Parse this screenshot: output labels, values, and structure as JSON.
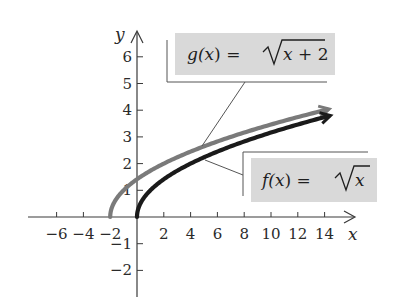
{
  "chart_data": {
    "type": "line",
    "title": "",
    "xlabel": "x",
    "ylabel": "y",
    "xlim": [
      -7.5,
      16
    ],
    "ylim": [
      -3,
      7
    ],
    "grid": false,
    "x_ticks": [
      -6,
      -4,
      -2,
      2,
      4,
      6,
      8,
      10,
      12,
      14
    ],
    "x_tick_labels": [
      "−6",
      "−4",
      "−2",
      "2",
      "4",
      "6",
      "8",
      "10",
      "12",
      "14"
    ],
    "y_ticks": [
      -2,
      -1,
      1,
      2,
      3,
      4,
      5,
      6
    ],
    "y_tick_labels": [
      "−2",
      "−1",
      "1",
      "2",
      "3",
      "4",
      "5",
      "6"
    ],
    "series": [
      {
        "name": "g(x) = √(x + 2)",
        "color": "#7a7a7a",
        "x": [
          -2,
          -1.5,
          -1,
          0,
          1,
          2,
          4,
          6,
          8,
          10,
          12,
          14
        ],
        "y": [
          0,
          0.71,
          1,
          1.41,
          1.73,
          2,
          2.45,
          2.83,
          3.16,
          3.46,
          3.74,
          4
        ]
      },
      {
        "name": "f(x) = √x",
        "color": "#1a1a1a",
        "x": [
          0,
          0.5,
          1,
          2,
          4,
          6,
          8,
          10,
          12,
          14
        ],
        "y": [
          0,
          0.71,
          1,
          1.41,
          2,
          2.45,
          2.83,
          3.16,
          3.46,
          3.74
        ]
      }
    ],
    "annotations": [
      {
        "text": "g(x) = √(x + 2)",
        "target_series": 0,
        "box_fill": "#d9d9d9"
      },
      {
        "text": "f(x) = √x",
        "target_series": 1,
        "box_fill": "#d9d9d9"
      }
    ]
  },
  "labels": {
    "g": {
      "prefix": "g(",
      "var": "x",
      "mid": ") = ",
      "rad_var": "x",
      "rad_rest": " + 2"
    },
    "f": {
      "prefix": "f(",
      "var": "x",
      "mid": ") = ",
      "rad_var": "x",
      "rad_rest": ""
    },
    "x_axis": "x",
    "y_axis": "y"
  }
}
